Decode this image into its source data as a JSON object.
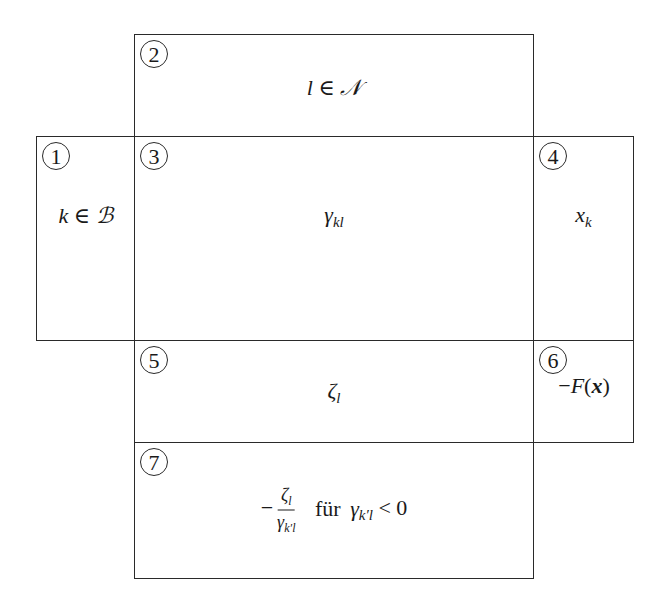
{
  "diagram": {
    "boxes": [
      {
        "id": 1,
        "label": "1",
        "content": "k ∈ ℬ",
        "meaning": "basic variable indices"
      },
      {
        "id": 2,
        "label": "2",
        "content": "l ∈ 𝒩",
        "meaning": "non-basic variable indices"
      },
      {
        "id": 3,
        "label": "3",
        "content": "γkl",
        "meaning": "tableau coefficients"
      },
      {
        "id": 4,
        "label": "4",
        "content": "xk",
        "meaning": "basic variable values"
      },
      {
        "id": 5,
        "label": "5",
        "content": "ζl",
        "meaning": "reduced costs"
      },
      {
        "id": 6,
        "label": "6",
        "content": "−F(x)",
        "meaning": "negative objective value"
      },
      {
        "id": 7,
        "label": "7",
        "content": "−ζl / γk'l für γk'l < 0",
        "meaning": "ratio test row"
      }
    ],
    "text": {
      "b1_k": "k",
      "b1_in": " ∈ ",
      "b1_set": "ℬ",
      "b2_l": "l",
      "b2_in": " ∈ ",
      "b2_set": "𝒩",
      "b3_gamma": "γ",
      "b3_sub": "kl",
      "b4_x": "x",
      "b4_sub": "k",
      "b5_zeta": "ζ",
      "b5_sub": "l",
      "b6_minus": "−",
      "b6_F": "F",
      "b6_open": "(",
      "b6_x": "x",
      "b6_close": ")",
      "b7_minus": "−",
      "b7_num": "ζ",
      "b7_num_sub": "l",
      "b7_den": "γ",
      "b7_den_sub": "k′l",
      "b7_fuer": "für",
      "b7_gamma": "γ",
      "b7_gamma_sub": "k′l",
      "b7_cond": " < 0"
    }
  }
}
